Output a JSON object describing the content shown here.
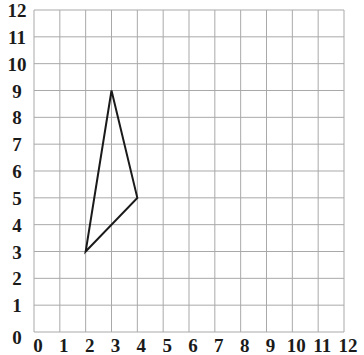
{
  "diagram": {
    "type": "coordinate-grid",
    "x_axis": {
      "min": 0,
      "max": 12,
      "step": 1,
      "tick_labels": [
        "0",
        "1",
        "2",
        "3",
        "4",
        "5",
        "6",
        "7",
        "8",
        "9",
        "10",
        "11",
        "12"
      ]
    },
    "y_axis": {
      "min": 0,
      "max": 12,
      "step": 1,
      "tick_labels": [
        "0",
        "1",
        "2",
        "3",
        "4",
        "5",
        "6",
        "7",
        "8",
        "9",
        "10",
        "11",
        "12"
      ]
    },
    "grid": true,
    "grid_color": "#a9a9a9",
    "line_color": "#1a1a1a",
    "shapes": [
      {
        "name": "triangle",
        "vertices": [
          [
            3,
            9
          ],
          [
            4,
            5
          ],
          [
            2,
            3
          ]
        ]
      }
    ]
  },
  "layout": {
    "plot_left": 34,
    "plot_right": 344,
    "plot_top": 10,
    "plot_bottom": 332
  }
}
